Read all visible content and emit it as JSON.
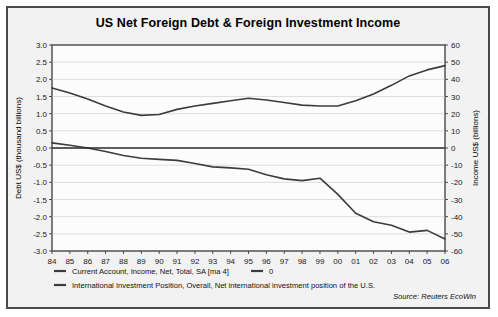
{
  "figure": {
    "title": "US Net Foreign Debt & Foreign Investment Income",
    "source": "Source: Reuters EcoWin"
  },
  "legend": {
    "entry_debt": "International Investment Position, Overall, Net international investment position of the U.S.",
    "entry_income": "Current Account, Income, Net, Total, SA [ma 4]",
    "entry_zero": "0"
  },
  "chart_data": {
    "type": "line",
    "title": "US Net Foreign Debt & Foreign Investment Income",
    "xlabel": "",
    "ylabel": "Debt US$ (thousand billions)",
    "y2label": "Income US$ (billions)",
    "grid": true,
    "legend_position": "bottom",
    "x": [
      "84",
      "85",
      "86",
      "87",
      "88",
      "89",
      "90",
      "91",
      "92",
      "93",
      "94",
      "95",
      "96",
      "97",
      "98",
      "99",
      "00",
      "01",
      "02",
      "03",
      "04",
      "05",
      "06"
    ],
    "xlim": [
      1984,
      2006
    ],
    "ylim": [
      -3.0,
      3.0
    ],
    "y2lim": [
      -60,
      60
    ],
    "yticks": [
      "3.0",
      "2.5",
      "2.0",
      "1.5",
      "1.0",
      "0.5",
      "0.0",
      "-0.5",
      "-1.0",
      "-1.5",
      "-2.0",
      "-2.5",
      "-3.0"
    ],
    "ytick_values": [
      3.0,
      2.5,
      2.0,
      1.5,
      1.0,
      0.5,
      0.0,
      -0.5,
      -1.0,
      -1.5,
      -2.0,
      -2.5,
      -3.0
    ],
    "y2ticks": [
      "60",
      "50",
      "40",
      "30",
      "20",
      "10",
      "0",
      "-10",
      "-20",
      "-30",
      "-40",
      "-50",
      "-60"
    ],
    "y2tick_values": [
      60,
      50,
      40,
      30,
      20,
      10,
      0,
      -10,
      -20,
      -30,
      -40,
      -50,
      -60
    ],
    "series": [
      {
        "name": "Current Account, Income, Net, Total, SA [ma 4]",
        "axis": "right",
        "unit": "US$ billions",
        "values": [
          35.0,
          32.0,
          28.5,
          24.5,
          21.0,
          19.0,
          19.5,
          22.5,
          24.5,
          26.0,
          27.5,
          29.0,
          28.0,
          26.5,
          25.0,
          24.5,
          24.5,
          27.5,
          31.5,
          36.5,
          42.0,
          45.5,
          48.0
        ]
      },
      {
        "name": "International Investment Position, Overall, Net international investment position of the U.S.",
        "axis": "left",
        "unit": "US$ thousand billions",
        "values": [
          0.15,
          0.08,
          0.0,
          -0.1,
          -0.22,
          -0.3,
          -0.33,
          -0.36,
          -0.45,
          -0.55,
          -0.58,
          -0.62,
          -0.78,
          -0.9,
          -0.95,
          -0.88,
          -1.35,
          -1.9,
          -2.15,
          -2.25,
          -2.45,
          -2.4,
          -2.65
        ]
      },
      {
        "name": "0",
        "axis": "left",
        "unit": "",
        "values": [
          0,
          0,
          0,
          0,
          0,
          0,
          0,
          0,
          0,
          0,
          0,
          0,
          0,
          0,
          0,
          0,
          0,
          0,
          0,
          0,
          0,
          0,
          0
        ]
      }
    ]
  }
}
